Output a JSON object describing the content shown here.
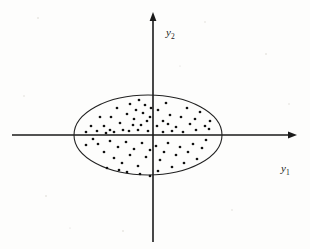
{
  "figure": {
    "background_color": "#fdfdfc",
    "ink_color": "#1a1a1a"
  },
  "axes": {
    "origin": {
      "x": 153,
      "y": 135
    },
    "horizontal": {
      "name": "y1-axis",
      "label": "y",
      "subscript": "1",
      "label_x": 281,
      "label_y": 172,
      "x_start": 12,
      "x_end": 297,
      "y": 135,
      "has_arrow": true
    },
    "vertical": {
      "name": "y2-axis",
      "label": "y",
      "subscript": "2",
      "label_x": 166,
      "label_y": 36,
      "y_start": 12,
      "y_end": 242,
      "x": 153,
      "has_arrow": true
    }
  },
  "ellipse": {
    "name": "confidence-ellipse",
    "cx": 148,
    "cy": 135,
    "rx": 74,
    "ry": 40,
    "stroke_color": "#222222"
  },
  "chart_data": {
    "type": "scatter",
    "title": "",
    "xlabel": "y1",
    "ylabel": "y2",
    "grid": false,
    "legend": false,
    "point_color": "#111111",
    "point_radius": 1.35,
    "xlim": [
      12,
      297
    ],
    "ylim": [
      12,
      242
    ],
    "n_points": 78,
    "points": [
      [
        104,
        126
      ],
      [
        111,
        117
      ],
      [
        117,
        108
      ],
      [
        120,
        123
      ],
      [
        127,
        114
      ],
      [
        130,
        104
      ],
      [
        134,
        119
      ],
      [
        136,
        110
      ],
      [
        139,
        100
      ],
      [
        141,
        125
      ],
      [
        143,
        113
      ],
      [
        145,
        105
      ],
      [
        147,
        121
      ],
      [
        129,
        131
      ],
      [
        123,
        130
      ],
      [
        114,
        132
      ],
      [
        106,
        133
      ],
      [
        97,
        131
      ],
      [
        91,
        126
      ],
      [
        86,
        132
      ],
      [
        100,
        117
      ],
      [
        110,
        130
      ],
      [
        133,
        125
      ],
      [
        138,
        130
      ],
      [
        148,
        131
      ],
      [
        150,
        117
      ],
      [
        151,
        108
      ],
      [
        158,
        110
      ],
      [
        163,
        121
      ],
      [
        166,
        103
      ],
      [
        170,
        115
      ],
      [
        176,
        127
      ],
      [
        181,
        117
      ],
      [
        187,
        108
      ],
      [
        190,
        124
      ],
      [
        195,
        119
      ],
      [
        200,
        112
      ],
      [
        205,
        126
      ],
      [
        210,
        121
      ],
      [
        157,
        126
      ],
      [
        172,
        131
      ],
      [
        183,
        132
      ],
      [
        196,
        130
      ],
      [
        209,
        129
      ],
      [
        163,
        132
      ],
      [
        168,
        124
      ],
      [
        98,
        144
      ],
      [
        104,
        152
      ],
      [
        110,
        141
      ],
      [
        114,
        158
      ],
      [
        118,
        147
      ],
      [
        122,
        163
      ],
      [
        126,
        142
      ],
      [
        130,
        155
      ],
      [
        134,
        149
      ],
      [
        138,
        166
      ],
      [
        142,
        143
      ],
      [
        146,
        157
      ],
      [
        150,
        150
      ],
      [
        93,
        139
      ],
      [
        86,
        145
      ],
      [
        107,
        168
      ],
      [
        127,
        172
      ],
      [
        119,
        170
      ],
      [
        140,
        174
      ],
      [
        156,
        146
      ],
      [
        160,
        160
      ],
      [
        164,
        152
      ],
      [
        168,
        143
      ],
      [
        172,
        167
      ],
      [
        176,
        155
      ],
      [
        180,
        147
      ],
      [
        184,
        163
      ],
      [
        188,
        152
      ],
      [
        193,
        144
      ],
      [
        197,
        159
      ],
      [
        202,
        148
      ],
      [
        206,
        140
      ],
      [
        158,
        171
      ],
      [
        150,
        176
      ]
    ]
  },
  "annotations": {
    "point_count_visible": false
  }
}
